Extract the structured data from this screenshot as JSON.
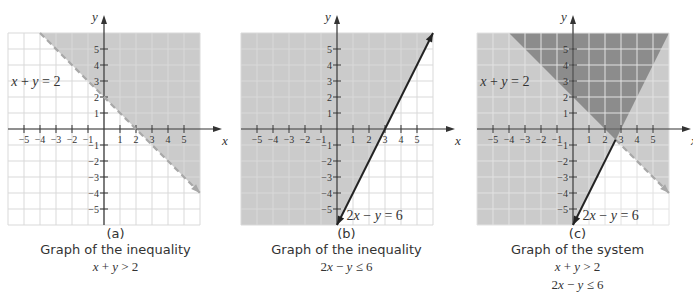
{
  "colors": {
    "light_shade": "#cbcbcb",
    "dark_shade": "#8c8c8c",
    "grid_line": "#d9d9d9",
    "grid_line_on_shade": "#dcdcdc",
    "grid_line_on_dark": "#e6e6e6",
    "axis": "#333333",
    "solid_line": "#222222",
    "dashed_line": "#a8a8a8"
  },
  "panels": [
    {
      "id": "a",
      "letter": "(a)",
      "title": "Graph of the inequality",
      "math_lines": [
        "x + y > 2"
      ],
      "line_label": "x + y = 2"
    },
    {
      "id": "b",
      "letter": "(b)",
      "title": "Graph of the inequality",
      "math_lines": [
        "2x − y ≤ 6"
      ],
      "line_label": "2x − y = 6"
    },
    {
      "id": "c",
      "letter": "(c)",
      "title": "Graph of the system",
      "math_lines": [
        "x + y > 2",
        "2x − y ≤ 6"
      ],
      "line_label_1": "x + y = 2",
      "line_label_2": "2x − y = 6"
    }
  ],
  "chart_data": [
    {
      "type": "area",
      "title": "Graph of the inequality x + y > 2",
      "subtitle": "(a)",
      "xlabel": "x",
      "ylabel": "y",
      "xlim": [
        -6,
        6
      ],
      "ylim": [
        -6,
        6
      ],
      "x_ticks": [
        -5,
        -4,
        -3,
        -2,
        -1,
        1,
        2,
        3,
        4,
        5
      ],
      "y_ticks": [
        -5,
        -4,
        -3,
        -2,
        -1,
        1,
        2,
        3,
        4,
        5
      ],
      "grid": true,
      "lines": [
        {
          "equation": "x + y = 2",
          "style": "dashed",
          "points": [
            [
              -4,
              6
            ],
            [
              6,
              -4
            ]
          ]
        }
      ],
      "shaded_region": {
        "inequality": "x + y > 2",
        "polygon": [
          [
            -4,
            6
          ],
          [
            6,
            6
          ],
          [
            6,
            -4
          ]
        ],
        "shade": "light"
      },
      "annotations": [
        {
          "text": "x + y = 2",
          "x": -5.8,
          "y": 2.7
        }
      ]
    },
    {
      "type": "area",
      "title": "Graph of the inequality 2x − y ≤ 6",
      "subtitle": "(b)",
      "xlabel": "x",
      "ylabel": "y",
      "xlim": [
        -6,
        6
      ],
      "ylim": [
        -6,
        6
      ],
      "x_ticks": [
        -5,
        -4,
        -3,
        -2,
        -1,
        1,
        2,
        3,
        4,
        5
      ],
      "y_ticks": [
        -5,
        -4,
        -3,
        -2,
        -1,
        1,
        2,
        3,
        4,
        5
      ],
      "grid": true,
      "lines": [
        {
          "equation": "2x − y = 6",
          "style": "solid",
          "points": [
            [
              0,
              -6
            ],
            [
              6,
              6
            ]
          ]
        }
      ],
      "shaded_region": {
        "inequality": "2x − y ≤ 6",
        "polygon": [
          [
            -6,
            6
          ],
          [
            6,
            6
          ],
          [
            0,
            -6
          ],
          [
            -6,
            -6
          ]
        ],
        "shade": "light"
      },
      "annotations": [
        {
          "text": "2x − y = 6",
          "x": 0.6,
          "y": -5.7
        }
      ]
    },
    {
      "type": "area",
      "title": "Graph of the system",
      "subtitle": "(c)",
      "system": [
        "x + y > 2",
        "2x − y ≤ 6"
      ],
      "xlabel": "x",
      "ylabel": "y",
      "xlim": [
        -6,
        6
      ],
      "ylim": [
        -6,
        6
      ],
      "x_ticks": [
        -5,
        -4,
        -3,
        -2,
        -1,
        1,
        2,
        3,
        4,
        5
      ],
      "y_ticks": [
        -5,
        -4,
        -3,
        -2,
        -1,
        1,
        2,
        3,
        4,
        5
      ],
      "grid": true,
      "lines": [
        {
          "equation": "x + y = 2",
          "style": "dashed",
          "points": [
            [
              2.667,
              -0.667
            ],
            [
              6,
              -4
            ]
          ]
        },
        {
          "equation": "2x − y = 6",
          "style": "solid",
          "points": [
            [
              0,
              -6
            ],
            [
              2.667,
              -0.667
            ]
          ]
        }
      ],
      "intersection": [
        2.667,
        -0.667
      ],
      "shaded_region": {
        "inequality": "x + y > 2 and 2x − y ≤ 6",
        "polygon": [
          [
            -4,
            6
          ],
          [
            6,
            6
          ],
          [
            2.667,
            -0.667
          ]
        ],
        "shade": "dark"
      },
      "annotations": [
        {
          "text": "x + y = 2",
          "x": -5.8,
          "y": 2.7
        },
        {
          "text": "2x − y = 6",
          "x": 0.6,
          "y": -5.7
        }
      ]
    }
  ]
}
